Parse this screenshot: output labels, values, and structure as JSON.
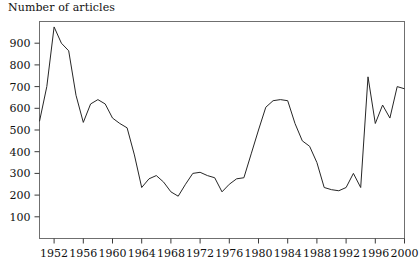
{
  "figure": {
    "axis_title": "Number of articles",
    "background_color": "#ffffff",
    "line_color": "#262626",
    "frame_color": "#6f6f6f"
  },
  "chart_data": {
    "type": "line",
    "title": "",
    "subtitle": "",
    "xlabel": "",
    "ylabel": "Number of articles",
    "grid": false,
    "legend": null,
    "xlim": [
      1950,
      2000
    ],
    "ylim": [
      0,
      1000
    ],
    "yticks": [
      100,
      200,
      300,
      400,
      500,
      600,
      700,
      800,
      900
    ],
    "ytick_labels": [
      "100",
      "200",
      "300",
      "400",
      "500",
      "600",
      "700",
      "800",
      "900"
    ],
    "xticks": [
      1952,
      1956,
      1960,
      1964,
      1968,
      1972,
      1976,
      1980,
      1984,
      1988,
      1992,
      1996,
      2000
    ],
    "xtick_labels": [
      "1952",
      "1956",
      "1960",
      "1964",
      "1968",
      "1972",
      "1976",
      "1980",
      "1984",
      "1988",
      "1992",
      "1996",
      "2000"
    ],
    "x": [
      1950,
      1951,
      1952,
      1953,
      1954,
      1955,
      1956,
      1957,
      1958,
      1959,
      1960,
      1961,
      1962,
      1963,
      1964,
      1965,
      1966,
      1967,
      1968,
      1969,
      1970,
      1971,
      1972,
      1973,
      1974,
      1975,
      1976,
      1977,
      1978,
      1979,
      1980,
      1981,
      1982,
      1983,
      1984,
      1985,
      1986,
      1987,
      1988,
      1989,
      1990,
      1991,
      1992,
      1993,
      1994,
      1995,
      1996,
      1997,
      1998,
      1999,
      2000
    ],
    "values": [
      540,
      700,
      975,
      900,
      865,
      660,
      535,
      620,
      640,
      620,
      555,
      530,
      510,
      385,
      235,
      275,
      290,
      260,
      215,
      195,
      250,
      300,
      305,
      290,
      280,
      215,
      250,
      275,
      280,
      390,
      500,
      605,
      635,
      640,
      635,
      530,
      450,
      425,
      350,
      235,
      225,
      220,
      235,
      300,
      235,
      745,
      530,
      615,
      555,
      700,
      690
    ],
    "series": [
      {
        "name": "Number of articles",
        "values": [
          540,
          700,
          975,
          900,
          865,
          660,
          535,
          620,
          640,
          620,
          555,
          530,
          510,
          385,
          235,
          275,
          290,
          260,
          215,
          195,
          250,
          300,
          305,
          290,
          280,
          215,
          250,
          275,
          280,
          390,
          500,
          605,
          635,
          640,
          635,
          530,
          450,
          425,
          350,
          235,
          225,
          220,
          235,
          300,
          235,
          745,
          530,
          615,
          555,
          700,
          690
        ]
      }
    ],
    "annotations": []
  }
}
